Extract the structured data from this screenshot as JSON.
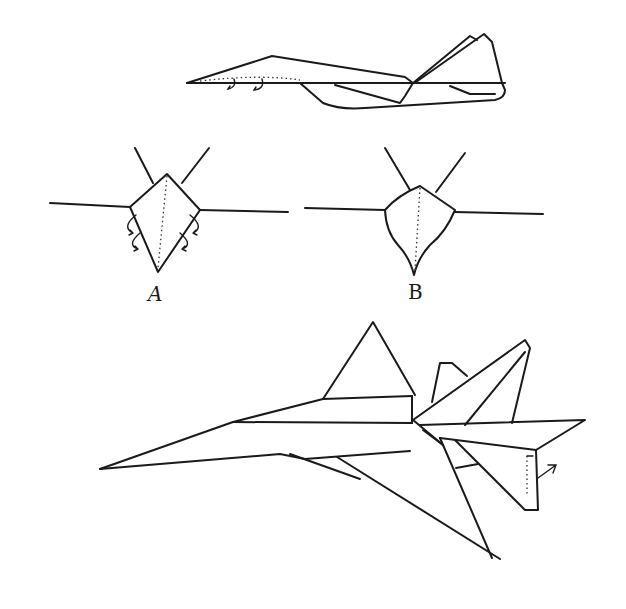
{
  "figure": {
    "type": "paper-airplane folding diagram",
    "views": [
      {
        "id": "side-view",
        "description": "Side profile of folded jet with fold arrows"
      },
      {
        "id": "front-view-a",
        "label": "A",
        "description": "Front view before folding with curled fold arrows"
      },
      {
        "id": "front-view-b",
        "label": "B",
        "description": "Front view after folding, curved body"
      },
      {
        "id": "finished-view",
        "description": "Three-quarter view of finished jet with elevator flap arrow"
      }
    ],
    "labels": {
      "a": "A",
      "b": "B"
    },
    "colors": {
      "ink": "#1a1a1a",
      "paper": "#ffffff"
    }
  }
}
